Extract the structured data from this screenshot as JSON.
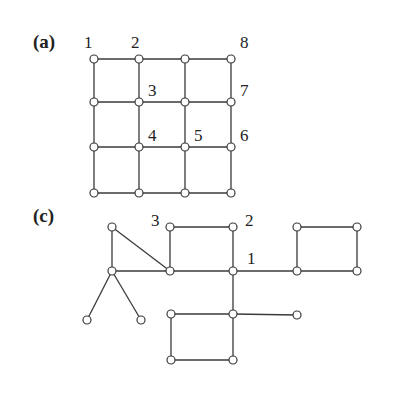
{
  "panels": [
    {
      "id": "a",
      "label": "(a)",
      "label_pos": [
        33,
        48
      ],
      "nodes": [
        {
          "x": 94,
          "y": 59
        },
        {
          "x": 139,
          "y": 59
        },
        {
          "x": 185,
          "y": 59
        },
        {
          "x": 231,
          "y": 59
        },
        {
          "x": 94,
          "y": 102
        },
        {
          "x": 139,
          "y": 102
        },
        {
          "x": 185,
          "y": 102
        },
        {
          "x": 231,
          "y": 102
        },
        {
          "x": 94,
          "y": 147
        },
        {
          "x": 139,
          "y": 147
        },
        {
          "x": 185,
          "y": 147
        },
        {
          "x": 231,
          "y": 147
        },
        {
          "x": 94,
          "y": 193
        },
        {
          "x": 139,
          "y": 193
        },
        {
          "x": 185,
          "y": 193
        },
        {
          "x": 231,
          "y": 193
        }
      ],
      "edges": [
        [
          0,
          1
        ],
        [
          1,
          2
        ],
        [
          2,
          3
        ],
        [
          4,
          5
        ],
        [
          5,
          6
        ],
        [
          6,
          7
        ],
        [
          8,
          9
        ],
        [
          9,
          10
        ],
        [
          10,
          11
        ],
        [
          12,
          13
        ],
        [
          13,
          14
        ],
        [
          14,
          15
        ],
        [
          0,
          4
        ],
        [
          4,
          8
        ],
        [
          8,
          12
        ],
        [
          1,
          5
        ],
        [
          5,
          9
        ],
        [
          9,
          13
        ],
        [
          2,
          6
        ],
        [
          6,
          10
        ],
        [
          10,
          14
        ],
        [
          3,
          7
        ],
        [
          7,
          11
        ],
        [
          11,
          15
        ]
      ],
      "node_labels": [
        {
          "text": "1",
          "x": 84,
          "y": 48
        },
        {
          "text": "2",
          "x": 131,
          "y": 48
        },
        {
          "text": "8",
          "x": 240,
          "y": 48
        },
        {
          "text": "3",
          "x": 148,
          "y": 96
        },
        {
          "text": "7",
          "x": 240,
          "y": 96
        },
        {
          "text": "4",
          "x": 148,
          "y": 141
        },
        {
          "text": "5",
          "x": 194,
          "y": 141
        },
        {
          "text": "6",
          "x": 240,
          "y": 141
        }
      ]
    },
    {
      "id": "c",
      "label": "(c)",
      "label_pos": [
        33,
        222
      ],
      "nodes": [
        {
          "x": 112,
          "y": 227
        },
        {
          "x": 112,
          "y": 271
        },
        {
          "x": 87,
          "y": 320
        },
        {
          "x": 141,
          "y": 320
        },
        {
          "x": 170,
          "y": 227
        },
        {
          "x": 170,
          "y": 271
        },
        {
          "x": 233,
          "y": 227
        },
        {
          "x": 233,
          "y": 271
        },
        {
          "x": 297,
          "y": 227
        },
        {
          "x": 357,
          "y": 227
        },
        {
          "x": 297,
          "y": 271
        },
        {
          "x": 357,
          "y": 271
        },
        {
          "x": 171,
          "y": 314
        },
        {
          "x": 233,
          "y": 314
        },
        {
          "x": 297,
          "y": 315
        },
        {
          "x": 171,
          "y": 360
        },
        {
          "x": 233,
          "y": 360
        }
      ],
      "edges": [
        [
          0,
          1
        ],
        [
          0,
          5
        ],
        [
          1,
          5
        ],
        [
          1,
          2
        ],
        [
          1,
          3
        ],
        [
          4,
          5
        ],
        [
          4,
          6
        ],
        [
          6,
          7
        ],
        [
          5,
          7
        ],
        [
          7,
          10
        ],
        [
          8,
          9
        ],
        [
          8,
          10
        ],
        [
          9,
          11
        ],
        [
          10,
          11
        ],
        [
          7,
          13
        ],
        [
          12,
          13
        ],
        [
          13,
          14
        ],
        [
          12,
          15
        ],
        [
          15,
          16
        ],
        [
          13,
          16
        ]
      ],
      "node_labels": [
        {
          "text": "3",
          "x": 151,
          "y": 226
        },
        {
          "text": "2",
          "x": 245,
          "y": 226
        },
        {
          "text": "1",
          "x": 247,
          "y": 264
        }
      ]
    }
  ]
}
